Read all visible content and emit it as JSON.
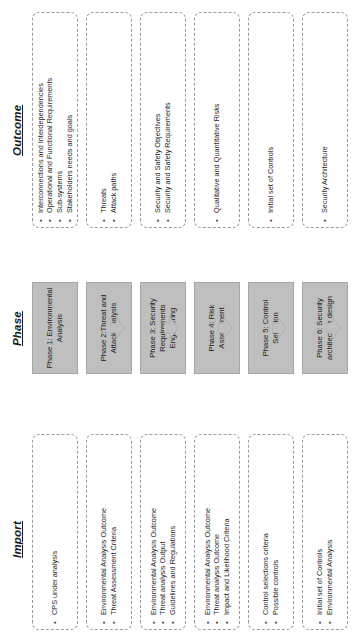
{
  "headers": {
    "import": "Import",
    "phase": "Phase",
    "outcome": "Outcome"
  },
  "bullet_glyph": "•",
  "colors": {
    "phase_fill": "#bfbfbf",
    "phase_border": "#a6a6a6",
    "box_border": "#9a9a9a",
    "arrow_fill": "#bfbfbf",
    "text": "#1a1a1a",
    "background": "#ffffff"
  },
  "rows": [
    {
      "import": [
        "CPS under analysis"
      ],
      "phase": "Phase 1: Environmental Analysis",
      "outcome": [
        "Interconnections and Interdependencies",
        "Operational and Functional Requirements",
        "Sub-systems",
        "Stakeholders needs and goals"
      ]
    },
    {
      "import": [
        "Environmental Analysis Outcome",
        "Threat Assessment Criteria"
      ],
      "phase": "Phase 2:Threat and Attack analysis",
      "outcome": [
        "Threats",
        "Attack paths"
      ]
    },
    {
      "import": [
        "Environmental Analysis Outcome",
        "Threat analysis Output",
        "Guidelines and Regulations"
      ],
      "phase": "Phase 3: Security Requirements Engineering",
      "outcome": [
        "Security and Safety Objectives",
        "Security and Safety Requirements"
      ]
    },
    {
      "import": [
        "Environmental Analysis Outcome",
        "Threat analysis Outcome",
        "Impact and Likelihood Criteria"
      ],
      "phase": "Phase 4: Risk Assessment",
      "outcome": [
        "Qualitative and Quantitative Risks"
      ]
    },
    {
      "import": [
        "Control selections criteria",
        "Possible controls"
      ],
      "phase": "Phase 5: Control Selection",
      "outcome": [
        "Initial set of Controls"
      ]
    },
    {
      "import": [
        "Initial set of Controls",
        "Environmental Analysis"
      ],
      "phase": "Phase 6: Security architecture design",
      "outcome": [
        "Security Architecture"
      ]
    }
  ]
}
